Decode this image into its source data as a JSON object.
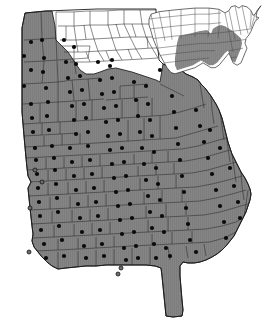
{
  "figure": {
    "kind": "choropleth-map",
    "title": "",
    "caption": "",
    "background_color": "#ffffff"
  },
  "colors": {
    "shaded_fill": "#858585",
    "unshaded_fill": "#ffffff",
    "county_border": "#2b2b2b",
    "state_border": "#1a1a1a",
    "dot_fill": "#0a0a0a",
    "hollow_dot_fill": "#6e6e6e",
    "inset_shaded_fill": "#8a8a8a",
    "inset_unshaded_fill": "#ffffff",
    "inset_border": "#4a4a4a"
  },
  "main_map": {
    "name": "georgia-county-map",
    "label": "Georgia",
    "shaded_region_label": "",
    "unshaded_region_label": "",
    "shaded_county_count": 120,
    "unshaded_county_count": 39,
    "filled_dot_count": 113,
    "hollow_dot_count": 5,
    "state_outline_path": "M 22,28 L 25,13 L 46,11 L 72,10 L 97,9 L 122,9 L 146,9 L 156,9 L 156,34 L 158,49 L 159,60 L 163,64 L 168,66 L 171,66 L 174,68 L 181,70 L 186,74 L 193,77 L 198,80 L 201,84 L 205,88 L 211,96 L 216,104 L 219,110 L 222,118 L 224,126 L 226,134 L 228,142 L 230,148 L 232,154 L 235,160 L 238,166 L 241,172 L 245,178 L 248,184 L 250,189 L 251,194 L 250,200 L 248,206 L 246,212 L 243,218 L 240,224 L 237,230 L 234,236 L 230,241 L 226,246 L 222,250 L 217,254 L 212,257 L 206,260 L 200,262 L 194,263 L 188,263 L 183,262 L 180,266 L 180,276 L 181,288 L 182,300 L 183,310 L 182,316 L 173,317 L 166,316 L 165,306 L 164,296 L 163,286 L 162,276 L 161,268 L 155,266 L 146,265 L 136,265 L 126,265 L 116,265 L 106,265 L 96,266 L 86,266 L 76,267 L 66,268 L 58,269 L 52,266 L 47,262 L 42,257 L 38,252 L 34,247 L 32,241 L 33,234 L 32,226 L 31,217 L 30,208 L 29,198 L 28,188 L 31,182 L 28,176 L 27,168 L 26,158 L 25,147 L 24,136 L 23,124 L 22,112 L 22,100 L 22,88 L 22,76 L 22,64 L 22,50 L 22,38 Z",
    "shaded_boundary_path": "M 22,28 L 25,13 L 46,11 L 52,11 L 55,26 L 56,40 L 60,44 L 64,48 L 68,52 L 72,58 L 76,64 L 80,70 L 86,74 L 94,74 L 100,72 L 108,69 L 116,68 L 124,70 L 132,72 L 138,74 L 144,76 L 150,78 L 156,80 L 160,82 L 163,64 L 168,66 L 174,68 L 181,70 L 186,74 L 193,77 L 198,80 L 201,84 L 205,88 L 211,96 L 216,104 L 219,110 L 222,118 L 224,126 L 226,134 L 228,142 L 230,148 L 232,154 L 235,160 L 238,166 L 241,172 L 245,178 L 248,184 L 250,189 L 251,194 L 250,200 L 248,206 L 246,212 L 243,218 L 240,224 L 237,230 L 234,236 L 230,241 L 226,246 L 222,250 L 217,254 L 212,257 L 206,260 L 200,262 L 194,263 L 188,263 L 183,262 L 180,266 L 180,276 L 181,288 L 182,300 L 183,310 L 182,316 L 173,317 L 166,316 L 165,306 L 164,296 L 163,286 L 162,276 L 161,268 L 155,266 L 146,265 L 136,265 L 126,265 L 116,265 L 106,265 L 96,266 L 86,266 L 76,267 L 66,268 L 58,269 L 52,266 L 47,262 L 42,257 L 38,252 L 34,247 L 32,241 L 33,234 L 32,226 L 31,217 L 30,208 L 29,198 L 28,188 L 31,182 L 28,176 L 27,168 L 26,158 L 25,147 L 24,136 L 23,124 L 22,112 L 22,100 L 22,88 L 22,76 L 22,64 L 22,50 L 22,38 Z",
    "county_border_paths": [
      "M 24,40 L 42,39 L 56,38",
      "M 24,62 L 44,61 L 57,60",
      "M 23,84 L 42,83 L 58,82",
      "M 23,104 L 40,103 L 58,102",
      "M 41,11 L 42,39 L 44,61 L 42,83",
      "M 56,12 L 56,38 L 57,60 L 58,82 L 58,102",
      "M 58,60 L 74,59 L 88,58",
      "M 62,46 L 78,46 L 90,46",
      "M 74,45 L 74,59 L 76,74",
      "M 88,58 L 90,46",
      "M 58,82 L 72,80 L 88,79 L 100,78",
      "M 58,102 L 74,101 L 90,100 L 104,99",
      "M 72,80 L 74,101",
      "M 88,79 L 90,100",
      "M 23,124 L 40,123 L 58,122 L 76,121 L 92,120 L 106,119",
      "M 40,103 L 40,123",
      "M 58,102 L 58,122",
      "M 76,101 L 76,121",
      "M 92,100 L 92,120",
      "M 24,136 L 42,135 L 60,134 L 78,133",
      "M 42,123 L 42,135",
      "M 60,122 L 60,134",
      "M 25,147 L 44,146 L 62,145 L 80,144 L 96,143 L 112,142",
      "M 44,136 L 44,146",
      "M 62,134 L 62,145",
      "M 80,133 L 80,144",
      "M 26,158 L 44,157 L 62,156 L 80,155 L 98,154 L 114,153",
      "M 27,170 L 46,169 L 64,168 L 82,167 L 100,166 L 116,165",
      "M 46,158 L 46,169",
      "M 64,157 L 64,168",
      "M 82,156 L 82,167",
      "M 100,155 L 100,166",
      "M 28,182 L 48,181 L 66,180 L 84,179 L 102,178 L 120,177",
      "M 48,170 L 48,181",
      "M 66,169 L 66,180",
      "M 84,168 L 84,179",
      "M 102,167 L 102,178",
      "M 29,196 L 48,195 L 68,194 L 86,193 L 104,192 L 122,191",
      "M 48,183 L 48,195",
      "M 68,182 L 68,194",
      "M 86,181 L 86,193",
      "M 104,180 L 104,192",
      "M 30,210 L 50,209 L 70,208 L 88,207 L 106,206 L 124,205",
      "M 50,197 L 50,209",
      "M 70,196 L 70,208",
      "M 88,195 L 88,207",
      "M 106,194 L 106,206",
      "M 31,224 L 52,223 L 72,222 L 90,221 L 108,220 L 126,219",
      "M 52,211 L 52,223",
      "M 72,210 L 72,222",
      "M 90,209 L 90,221",
      "M 108,208 L 108,220",
      "M 32,238 L 54,237 L 74,236 L 92,235 L 110,234 L 128,233",
      "M 54,225 L 54,237",
      "M 74,224 L 74,236",
      "M 92,223 L 92,235",
      "M 110,222 L 110,234",
      "M 36,251 L 58,250 L 78,249 L 96,248 L 114,247 L 132,246",
      "M 58,239 L 58,250",
      "M 78,238 L 78,249",
      "M 96,237 L 96,248",
      "M 114,236 L 114,247",
      "M 58,252 L 58,268",
      "M 78,251 L 78,267",
      "M 96,250 L 96,266",
      "M 114,249 L 114,265",
      "M 132,248 L 132,265",
      "M 150,247 L 150,265",
      "M 106,100 L 120,99 L 134,98 L 148,97",
      "M 120,86 L 134,85 L 148,84",
      "M 120,86 L 120,99",
      "M 134,85 L 134,98",
      "M 106,119 L 122,118 L 138,117 L 152,116 L 166,115",
      "M 122,100 L 122,118",
      "M 138,99 L 138,117",
      "M 152,98 L 152,116",
      "M 112,142 L 128,141 L 144,140 L 160,139 L 176,138",
      "M 128,120 L 128,141",
      "M 144,118 L 144,140",
      "M 160,116 L 160,139",
      "M 114,153 L 132,152 L 148,151 L 164,150 L 182,149",
      "M 116,165 L 134,164 L 152,163 L 168,162 L 186,161",
      "M 134,154 L 134,164",
      "M 152,152 L 152,163",
      "M 168,151 L 168,162",
      "M 120,177 L 138,176 L 156,175 L 174,174 L 192,173",
      "M 138,166 L 138,176",
      "M 156,164 L 156,175",
      "M 174,163 L 174,174",
      "M 122,191 L 140,190 L 158,189 L 176,188 L 196,187",
      "M 140,178 L 140,190",
      "M 158,176 L 158,189",
      "M 176,175 L 176,188",
      "M 124,205 L 144,204 L 162,203 L 182,202 L 200,201",
      "M 144,192 L 144,204",
      "M 162,190 L 162,203",
      "M 182,189 L 182,202",
      "M 126,219 L 146,218 L 166,217 L 186,216 L 204,215",
      "M 146,206 L 146,218",
      "M 166,204 L 166,217",
      "M 186,203 L 186,215",
      "M 128,233 L 148,232 L 168,231 L 188,230 L 206,229",
      "M 148,220 L 148,232",
      "M 168,218 L 168,231",
      "M 188,217 L 188,230",
      "M 132,246 L 152,245 L 172,244 L 192,243 L 210,242",
      "M 152,234 L 152,245",
      "M 172,232 L 172,244",
      "M 192,231 L 192,243",
      "M 168,247 L 170,260",
      "M 186,246 L 188,258",
      "M 204,244 L 206,256",
      "M 160,84 L 172,90 L 184,96",
      "M 166,115 L 180,112 L 194,108 L 206,104",
      "M 176,138 L 190,134 L 204,130 L 218,126",
      "M 182,149 L 198,146 L 212,142 L 226,138",
      "M 186,161 L 202,158 L 216,154 L 230,150",
      "M 192,173 L 208,170 L 222,166 L 236,162",
      "M 196,187 L 212,184 L 228,180 L 242,176",
      "M 200,201 L 216,198 L 232,194 L 246,190",
      "M 204,215 L 220,212 L 234,208 L 248,204",
      "M 206,229 L 222,226 L 236,222 L 246,216",
      "M 210,242 L 224,238 L 236,232",
      "M 200,84 L 202,96 L 204,108",
      "M 211,96 L 212,110 L 214,124",
      "M 220,112 L 222,126 L 224,140",
      "M 226,134 L 228,148 L 230,162",
      "M 232,154 L 234,168 L 236,182",
      "M 241,172 L 242,186 L 244,200",
      "M 248,190 L 246,204 L 244,218"
    ],
    "unshaded_county_border_paths": [
      "M 56,12 L 72,12 L 88,11 L 104,11 L 120,10 L 140,10 L 156,10",
      "M 58,26 L 74,26 L 90,25 L 108,25 L 124,24 L 142,24 L 156,24",
      "M 60,40 L 76,40 L 94,39 L 112,38 L 130,37 L 146,37 L 156,37",
      "M 64,52 L 82,52 L 100,51 L 118,50 L 136,49 L 152,48 L 157,48",
      "M 70,62 L 88,62 L 106,61 L 124,60 L 142,59 L 158,58",
      "M 74,12 L 74,26 L 76,40 L 78,52",
      "M 90,11 L 90,25 L 94,39 L 98,51 L 104,61",
      "M 108,11 L 108,25 L 112,38 L 116,50 L 122,60",
      "M 124,10 L 124,24 L 130,37 L 136,49 L 142,59",
      "M 140,10 L 142,24 L 146,37 L 152,48 L 158,58",
      "M 66,26 L 66,40",
      "M 84,25 L 86,39",
      "M 116,24 L 120,37",
      "M 132,24 L 136,37",
      "M 86,52 L 90,62",
      "M 106,51 L 110,61",
      "M 128,49 L 132,59",
      "M 147,37 L 148,48"
    ],
    "filled_dots": [
      [
        31,
        42
      ],
      [
        42,
        40
      ],
      [
        24,
        56
      ],
      [
        31,
        70
      ],
      [
        44,
        58
      ],
      [
        43,
        72
      ],
      [
        24,
        86
      ],
      [
        46,
        88
      ],
      [
        31,
        104
      ],
      [
        48,
        102
      ],
      [
        47,
        116
      ],
      [
        32,
        118
      ],
      [
        33,
        132
      ],
      [
        49,
        130
      ],
      [
        35,
        148
      ],
      [
        52,
        146
      ],
      [
        36,
        160
      ],
      [
        54,
        158
      ],
      [
        37,
        174
      ],
      [
        55,
        170
      ],
      [
        38,
        188
      ],
      [
        56,
        184
      ],
      [
        39,
        202
      ],
      [
        57,
        198
      ],
      [
        40,
        216
      ],
      [
        58,
        212
      ],
      [
        41,
        230
      ],
      [
        59,
        226
      ],
      [
        44,
        244
      ],
      [
        62,
        240
      ],
      [
        46,
        258
      ],
      [
        64,
        256
      ],
      [
        64,
        40
      ],
      [
        74,
        47
      ],
      [
        66,
        62
      ],
      [
        76,
        64
      ],
      [
        68,
        78
      ],
      [
        80,
        76
      ],
      [
        70,
        92
      ],
      [
        82,
        90
      ],
      [
        72,
        106
      ],
      [
        84,
        104
      ],
      [
        74,
        120
      ],
      [
        86,
        118
      ],
      [
        76,
        134
      ],
      [
        88,
        132
      ],
      [
        70,
        148
      ],
      [
        88,
        146
      ],
      [
        72,
        162
      ],
      [
        90,
        160
      ],
      [
        74,
        176
      ],
      [
        92,
        174
      ],
      [
        76,
        190
      ],
      [
        94,
        188
      ],
      [
        78,
        204
      ],
      [
        96,
        202
      ],
      [
        80,
        218
      ],
      [
        98,
        216
      ],
      [
        82,
        232
      ],
      [
        100,
        230
      ],
      [
        84,
        246
      ],
      [
        102,
        244
      ],
      [
        86,
        258
      ],
      [
        104,
        256
      ],
      [
        98,
        62
      ],
      [
        110,
        66
      ],
      [
        100,
        80
      ],
      [
        112,
        78
      ],
      [
        102,
        94
      ],
      [
        114,
        92
      ],
      [
        104,
        108
      ],
      [
        116,
        106
      ],
      [
        106,
        122
      ],
      [
        118,
        120
      ],
      [
        108,
        136
      ],
      [
        120,
        134
      ],
      [
        110,
        150
      ],
      [
        122,
        148
      ],
      [
        112,
        164
      ],
      [
        124,
        162
      ],
      [
        114,
        178
      ],
      [
        126,
        176
      ],
      [
        116,
        192
      ],
      [
        128,
        190
      ],
      [
        118,
        206
      ],
      [
        130,
        204
      ],
      [
        120,
        220
      ],
      [
        132,
        218
      ],
      [
        122,
        234
      ],
      [
        134,
        232
      ],
      [
        124,
        248
      ],
      [
        136,
        246
      ],
      [
        126,
        260
      ],
      [
        138,
        258
      ],
      [
        134,
        82
      ],
      [
        146,
        86
      ],
      [
        136,
        100
      ],
      [
        148,
        104
      ],
      [
        138,
        116
      ],
      [
        150,
        120
      ],
      [
        140,
        132
      ],
      [
        152,
        136
      ],
      [
        142,
        148
      ],
      [
        154,
        152
      ],
      [
        144,
        164
      ],
      [
        156,
        168
      ],
      [
        146,
        180
      ],
      [
        158,
        184
      ],
      [
        148,
        196
      ],
      [
        160,
        200
      ],
      [
        150,
        212
      ],
      [
        162,
        216
      ],
      [
        152,
        228
      ],
      [
        164,
        232
      ],
      [
        154,
        244
      ],
      [
        166,
        248
      ],
      [
        156,
        258
      ],
      [
        170,
        256
      ],
      [
        160,
        70
      ],
      [
        172,
        96
      ],
      [
        174,
        112
      ],
      [
        176,
        128
      ],
      [
        178,
        144
      ],
      [
        180,
        160
      ],
      [
        182,
        176
      ],
      [
        184,
        192
      ],
      [
        186,
        208
      ],
      [
        188,
        224
      ],
      [
        190,
        240
      ],
      [
        196,
        252
      ],
      [
        196,
        110
      ],
      [
        200,
        126
      ],
      [
        204,
        142
      ],
      [
        208,
        158
      ],
      [
        212,
        174
      ],
      [
        216,
        190
      ],
      [
        220,
        206
      ],
      [
        224,
        222
      ],
      [
        226,
        238
      ],
      [
        210,
        130
      ],
      [
        220,
        148
      ],
      [
        230,
        168
      ],
      [
        234,
        186
      ],
      [
        238,
        202
      ],
      [
        240,
        218
      ],
      [
        112,
        60
      ]
    ],
    "hollow_dots": [
      [
        35,
        170
      ],
      [
        42,
        182
      ],
      [
        30,
        208
      ],
      [
        29,
        252
      ],
      [
        118,
        274
      ],
      [
        121,
        268
      ]
    ]
  },
  "inset_map": {
    "name": "us-inset-map",
    "label": "United States",
    "highlighted_region_label": "Southeastern United States",
    "shaded_state_count": 16,
    "us_outline_path": "M 4,14 L 6,10 L 14,8 L 24,7 L 36,6 L 50,5 L 64,5 L 74,6 L 80,9 L 84,7 L 86,4 L 90,3 L 94,5 L 97,3 L 102,4 L 106,7 L 108,11 L 110,10 L 113,6 L 116,3 L 112,8 L 111,12 L 114,13 L 110,16 L 108,20 L 106,24 L 104,27 L 101,30 L 100,34 L 102,38 L 100,42 L 98,46 L 96,50 L 92,52 L 88,50 L 86,46 L 84,42 L 82,44 L 78,48 L 74,52 L 70,54 L 66,54 L 62,52 L 58,50 L 54,52 L 50,54 L 46,55 L 42,56 L 38,57 L 34,58 L 30,59 L 26,58 L 22,54 L 18,48 L 14,42 L 11,36 L 8,30 L 6,24 L 4,19 Z",
    "highlight_path": "M 34,28 L 44,26 L 54,24 L 62,23 L 66,26 L 68,22 L 72,20 L 76,19 L 80,20 L 84,22 L 88,24 L 92,27 L 96,30 L 97,34 L 96,38 L 94,42 L 92,46 L 90,50 L 87,48 L 85,44 L 83,40 L 80,42 L 76,46 L 72,50 L 68,52 L 64,52 L 60,50 L 56,48 L 52,50 L 48,52 L 44,53 L 40,54 L 36,55 L 32,56 L 30,52 L 30,46 L 31,40 L 32,34 Z",
    "state_border_paths": [
      "M 6,10 L 8,18 L 10,26 L 12,34 L 14,42",
      "M 14,8 L 16,16 L 18,24 L 20,32",
      "M 24,7 L 25,15 L 26,23 L 27,31",
      "M 36,6 L 36,14 L 36,22 L 36,30",
      "M 50,5 L 50,13 L 50,21 L 50,29",
      "M 64,5 L 64,13 L 64,21 L 63,29",
      "M 74,6 L 74,14 L 74,22 L 73,30",
      "M 4,14 L 14,13 L 26,12 L 38,11 L 50,10 L 64,10 L 76,9",
      "M 6,22 L 18,21 L 28,20 L 40,19 L 52,18 L 64,18 L 76,17",
      "M 8,30 L 20,29 L 30,28 L 42,27 L 54,26 L 66,26 L 78,25",
      "M 11,38 L 22,37 L 32,36 L 44,35 L 56,34 L 68,34 L 80,33",
      "M 14,44 L 24,43 L 34,42 L 46,41 L 58,40 L 70,40",
      "M 20,50 L 30,49 L 40,48 L 52,47 L 64,46",
      "M 80,9 L 82,17 L 84,25 L 86,33 L 88,41",
      "M 84,7 L 86,15 L 88,23 L 90,31",
      "M 90,3 L 92,11 L 94,19 L 96,27",
      "M 97,3 L 99,11 L 101,19 L 103,26",
      "M 106,7 L 106,14 L 105,21",
      "M 78,25 L 88,24 L 98,23 L 106,22",
      "M 80,33 L 90,32 L 99,31 L 106,30",
      "M 84,40 L 92,39 L 98,38",
      "M 86,46 L 92,45",
      "M 110,10 L 108,16 L 106,22",
      "M 113,6 L 112,11 L 111,15"
    ]
  }
}
